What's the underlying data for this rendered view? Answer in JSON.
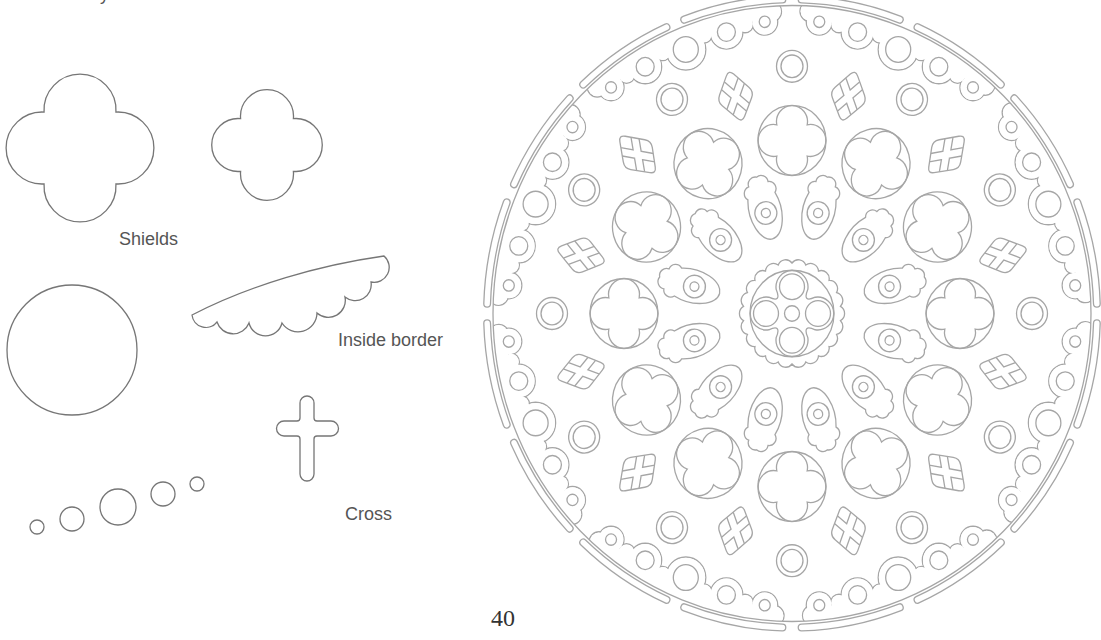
{
  "page": {
    "number": "40",
    "top_text_fragment": "y"
  },
  "labels": {
    "shields": "Shields",
    "inside_border": "Inside border",
    "cross": "Cross"
  },
  "pattern_pieces": [
    {
      "name": "shield-large"
    },
    {
      "name": "shield-small"
    },
    {
      "name": "circle-large"
    },
    {
      "name": "inside-border-piece"
    },
    {
      "name": "cross-piece"
    },
    {
      "name": "graduated-dots",
      "count": 5
    }
  ],
  "rose_window": {
    "outer_bars": 16,
    "border_groups": 8,
    "border_circles_per_group": 5,
    "rings": 12,
    "kites": 12,
    "quatrefoil_panels": 12,
    "eyes": 12,
    "center_lobes": 4
  },
  "colors": {
    "background": "#ffffff",
    "line": "#767676",
    "rose_line": "#a6a6a6",
    "text": "#555555",
    "page_number": "#333333"
  }
}
